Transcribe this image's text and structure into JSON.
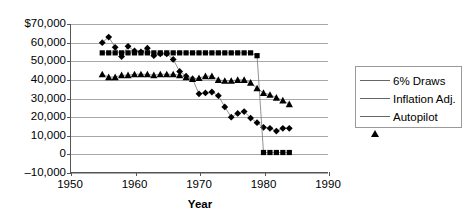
{
  "chart_data": {
    "type": "line",
    "title": "",
    "xlabel": "Year",
    "ylabel": "",
    "xlim": [
      1950,
      1990
    ],
    "ylim": [
      -10000,
      70000
    ],
    "grid": true,
    "legend_position": "right",
    "x_ticks": [
      "1950",
      "1960",
      "1970",
      "1980",
      "1990"
    ],
    "x_tick_values": [
      1950,
      1960,
      1970,
      1980,
      1990
    ],
    "y_ticks": [
      "$70,000",
      "60,000",
      "50,000",
      "40,000",
      "30,000",
      "20,000",
      "10,000",
      "0",
      "-10,000"
    ],
    "y_tick_values": [
      70000,
      60000,
      50000,
      40000,
      30000,
      20000,
      10000,
      0,
      -10000
    ],
    "x": [
      1955,
      1956,
      1957,
      1958,
      1959,
      1960,
      1961,
      1962,
      1963,
      1964,
      1965,
      1966,
      1967,
      1968,
      1969,
      1970,
      1971,
      1972,
      1973,
      1974,
      1975,
      1976,
      1977,
      1978,
      1979,
      1980,
      1981,
      1982,
      1983,
      1984
    ],
    "series": [
      {
        "name": "6% Draws",
        "marker": "diamond",
        "values": [
          60000,
          63000,
          57500,
          52500,
          58000,
          55500,
          55000,
          57000,
          53000,
          54000,
          54000,
          51000,
          44500,
          42000,
          40500,
          32500,
          33000,
          33500,
          31500,
          25500,
          20000,
          22000,
          23000,
          19500,
          17000,
          14500,
          14000,
          12500,
          14000,
          14000
        ]
      },
      {
        "name": "Inflation Adj.",
        "marker": "square",
        "values": [
          54500,
          54500,
          54500,
          54500,
          54500,
          54500,
          54500,
          54500,
          54500,
          54500,
          54500,
          54500,
          54500,
          54500,
          54500,
          54500,
          54500,
          54500,
          54500,
          54500,
          54500,
          54500,
          54500,
          54500,
          53000,
          1000,
          1000,
          1000,
          1000,
          1000
        ]
      },
      {
        "name": "Autopilot",
        "marker": "triangle",
        "values": [
          43000,
          41500,
          41500,
          42500,
          42500,
          43000,
          43000,
          43000,
          42500,
          43000,
          43000,
          43000,
          42500,
          41500,
          40500,
          41000,
          42000,
          42000,
          40000,
          39500,
          39500,
          40000,
          40000,
          38500,
          35500,
          33000,
          32000,
          30500,
          29000,
          27000
        ]
      }
    ]
  },
  "legend": {
    "items": [
      {
        "label": "6% Draws",
        "marker": "diamond"
      },
      {
        "label": "Inflation Adj.",
        "marker": "square"
      },
      {
        "label": "Autopilot",
        "marker": "triangle"
      }
    ]
  },
  "colors": {
    "series": "#000000",
    "grid": "#a8a8a8",
    "axis": "#555555",
    "background": "#ffffff"
  }
}
